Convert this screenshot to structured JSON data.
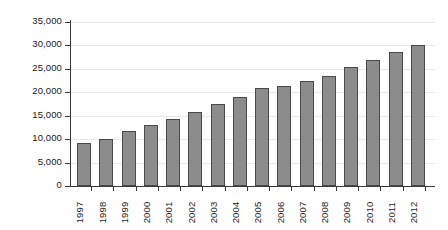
{
  "chart_data": {
    "type": "bar",
    "title": "",
    "subtitle": "",
    "xlabel": "",
    "ylabel": "",
    "ylim": [
      0,
      35000
    ],
    "ytick_step": 5000,
    "ytick_labels": [
      "35,000",
      "30,000",
      "25,000",
      "20,000",
      "15,000",
      "10,000",
      "5,000",
      "0"
    ],
    "ytick_values": [
      35000,
      30000,
      25000,
      20000,
      15000,
      10000,
      5000,
      0
    ],
    "grid": true,
    "grid_axis": "y",
    "legend": false,
    "legend_position": "none",
    "bar_color": "#8c8c8c",
    "bar_edge_color": "#4a4a4a",
    "axis_color": "#3a3a3a",
    "gridline_color": "#e9e9e9",
    "categories": [
      "1997",
      "1998",
      "1999",
      "2000",
      "2001",
      "2002",
      "2003",
      "2004",
      "2005",
      "2006",
      "2007",
      "2008",
      "2009",
      "2010",
      "2011",
      "2012"
    ],
    "values": [
      9200,
      10000,
      11800,
      13000,
      14300,
      15900,
      17400,
      19000,
      20900,
      21400,
      22400,
      23400,
      25500,
      26800,
      28500,
      30000
    ],
    "xtick_rotation": -90
  }
}
